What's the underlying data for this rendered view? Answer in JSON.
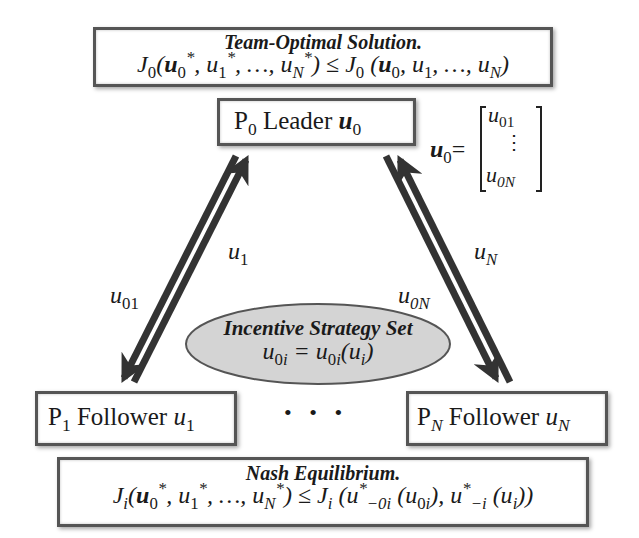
{
  "team_box": {
    "title": "Team-Optimal Solution.",
    "eq_lhs_fn": "J",
    "eq_lhs_sub": "0",
    "eq_op": "≤",
    "eq_rhs_fn": "J",
    "eq_rhs_sub": "0"
  },
  "leader_box": {
    "p": "P",
    "p_sub": "0",
    "label": "Leader",
    "var": "u",
    "var_sub": "0"
  },
  "matrix": {
    "lhs": "u",
    "lhs_sub": "0",
    "eq": "=",
    "top": "u",
    "top_sub": "01",
    "dots": "⋮",
    "bottom": "u",
    "bottom_sub": "0N"
  },
  "arrows": {
    "left_up_label": {
      "v": "u",
      "sub": "1"
    },
    "left_down_label": {
      "v": "u",
      "sub": "01"
    },
    "right_up_label": {
      "v": "u",
      "sub": "N"
    },
    "right_down_label": {
      "v": "u",
      "sub": "0N"
    },
    "color": "#333333"
  },
  "incentive": {
    "title": "Incentive Strategy Set",
    "eq": "u0i = u0i(ui)",
    "fill": "#d4d4d4"
  },
  "follower1": {
    "p": "P",
    "p_sub": "1",
    "label": "Follower",
    "var": "u",
    "var_sub": "1"
  },
  "followerN": {
    "p": "P",
    "p_sub": "N",
    "label": "Follower",
    "var": "u",
    "var_sub": "N"
  },
  "ellipsis": "• • •",
  "nash_box": {
    "title": "Nash Equilibrium.",
    "eq_fn": "J",
    "eq_sub": "i",
    "eq_op": "≤"
  }
}
